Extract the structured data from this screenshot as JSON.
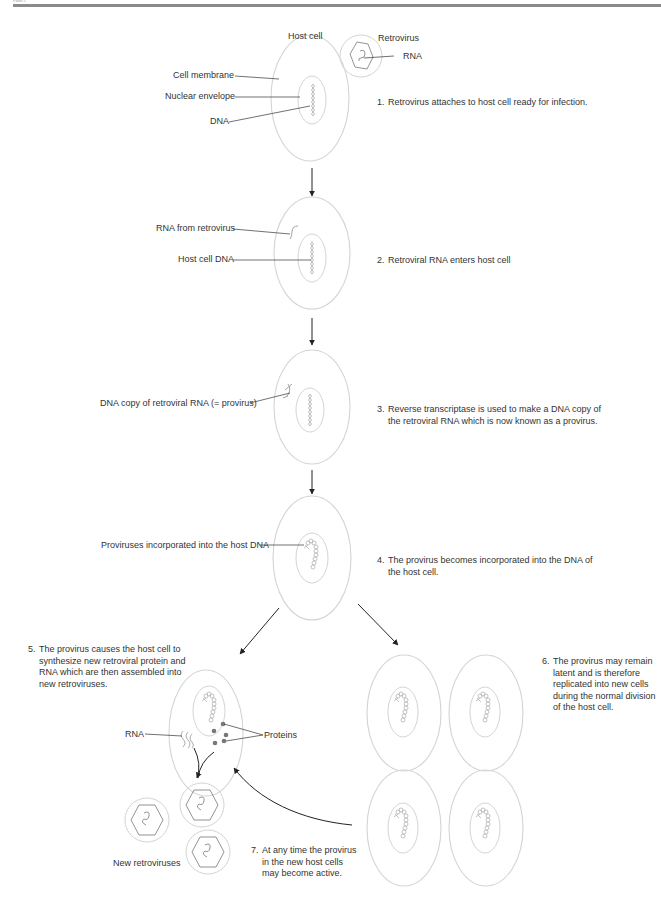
{
  "header": {
    "running_head": "Plate 5"
  },
  "labels": {
    "host_cell": "Host cell",
    "retrovirus": "Retrovirus",
    "rna": "RNA",
    "cell_membrane": "Cell membrane",
    "nuclear_envelope": "Nuclear envelope",
    "dna": "DNA",
    "rna_from_retrovirus": "RNA from retrovirus",
    "host_cell_dna": "Host cell DNA",
    "dna_copy": "DNA copy of retroviral RNA (= provirus)",
    "proviruses_incorporated": "Proviruses incorporated into the host DNA",
    "rna_stage5": "RNA",
    "proteins": "Proteins",
    "new_retroviruses": "New retroviruses"
  },
  "steps": [
    {
      "num": "1.",
      "text": "Retrovirus attaches to host cell ready for infection."
    },
    {
      "num": "2.",
      "text": "Retroviral RNA enters host cell"
    },
    {
      "num": "3.",
      "text": "Reverse transcriptase is used to make a DNA copy of the retroviral RNA which is now known as a provirus."
    },
    {
      "num": "4.",
      "text": "The provirus becomes incorporated into the DNA of the host cell."
    },
    {
      "num": "5.",
      "text": "The provirus causes the host cell to synthesize new retroviral protein and RNA which are then assembled into new retroviruses."
    },
    {
      "num": "6.",
      "text": "The provirus may remain latent and is therefore replicated into new cells during the normal division of the host cell."
    },
    {
      "num": "7.",
      "text": "At any time the provirus in the new host cells may become active."
    }
  ],
  "colors": {
    "cell_outline": "#d4d4d4",
    "leader_line": "#333333",
    "arrow": "#222222",
    "protein_dot": "#777777",
    "header_rule": "#8a8a8a"
  }
}
